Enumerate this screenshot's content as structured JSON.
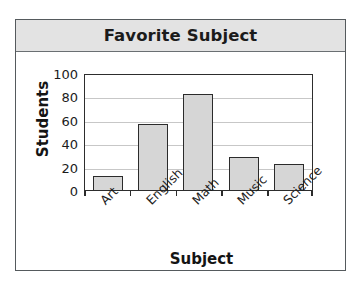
{
  "figure": {
    "title": "Favorite Subject",
    "frame_color": "#555a5d",
    "title_band_color": "#e3e3e3"
  },
  "chart_data": {
    "type": "bar",
    "title": "Favorite Subject",
    "xlabel": "Subject",
    "ylabel": "Students",
    "categories": [
      "Art",
      "English",
      "Math",
      "Music",
      "Science"
    ],
    "values": [
      12,
      56,
      82,
      28,
      22
    ],
    "ylim": [
      0,
      100
    ],
    "yticks": [
      0,
      20,
      40,
      60,
      80,
      100
    ],
    "ytick_labels": [
      "0",
      "20",
      "40",
      "60",
      "80",
      "100"
    ],
    "grid": true,
    "grid_axis": "y",
    "legend": false,
    "bar_fill": "#d6d6d6",
    "bar_edge": "#2b2b2b",
    "xtick_label_rotation": 45
  }
}
